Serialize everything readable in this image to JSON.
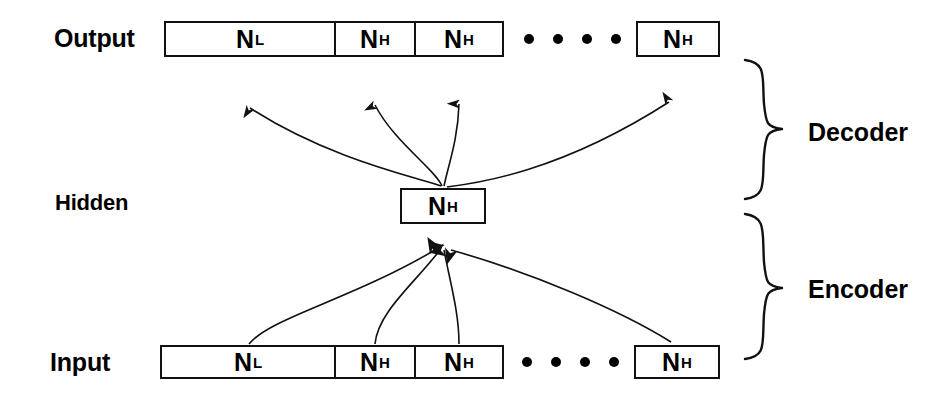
{
  "figure": {
    "type": "neural-network-architecture-diagram"
  },
  "layers": {
    "output": {
      "label": "Output",
      "units": [
        {
          "symbol": "N",
          "subscript": "L",
          "name": "N_L"
        },
        {
          "symbol": "N",
          "subscript": "H",
          "name": "N_H"
        },
        {
          "symbol": "N",
          "subscript": "H",
          "name": "N_H"
        },
        {
          "symbol": "N",
          "subscript": "H",
          "name": "N_H"
        }
      ],
      "ellipsis_dots": 4
    },
    "hidden": {
      "label": "Hidden",
      "units": [
        {
          "symbol": "N",
          "subscript": "H",
          "name": "N_H"
        }
      ]
    },
    "input": {
      "label": "Input",
      "units": [
        {
          "symbol": "N",
          "subscript": "L",
          "name": "N_L"
        },
        {
          "symbol": "N",
          "subscript": "H",
          "name": "N_H"
        },
        {
          "symbol": "N",
          "subscript": "H",
          "name": "N_H"
        },
        {
          "symbol": "N",
          "subscript": "H",
          "name": "N_H"
        }
      ],
      "ellipsis_dots": 4
    }
  },
  "sections": {
    "decoder": {
      "label": "Decoder"
    },
    "encoder": {
      "label": "Encoder"
    }
  },
  "colors": {
    "stroke": "#111111",
    "fill": "#ffffff",
    "text": "#000000"
  }
}
